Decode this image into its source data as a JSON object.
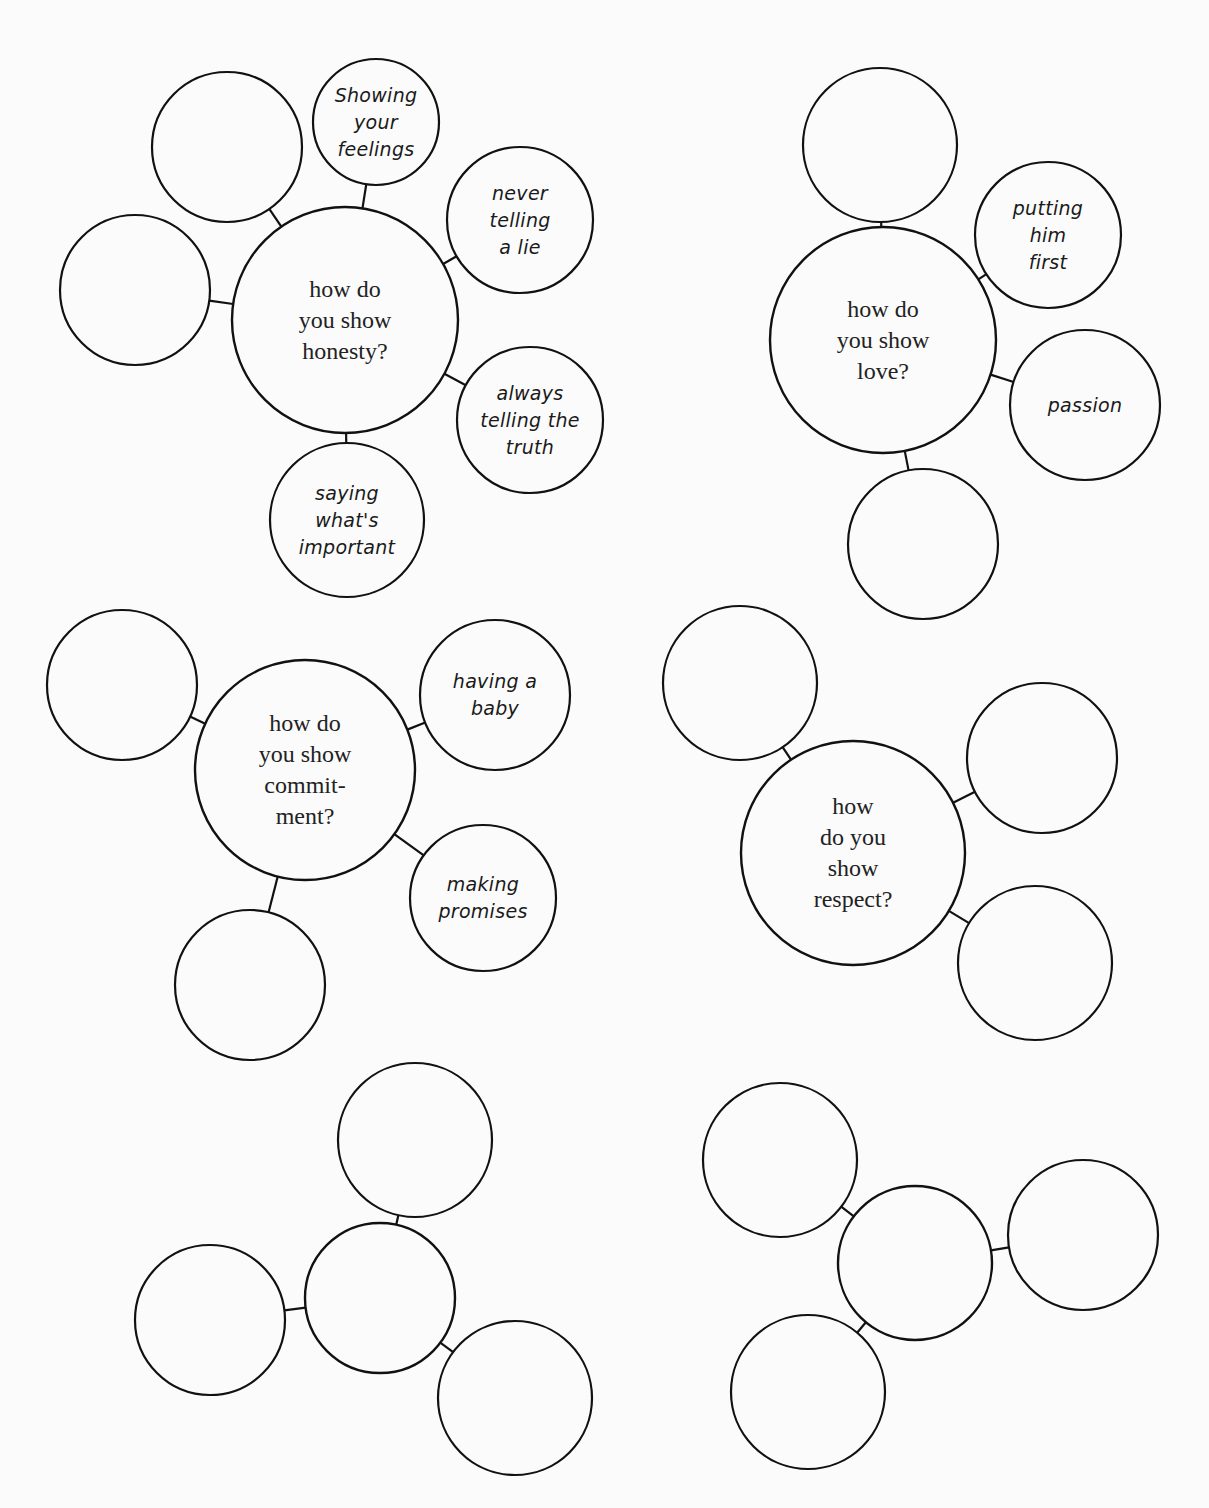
{
  "page": {
    "type": "worksheet",
    "colors": {
      "background": "#fbfbfb",
      "stroke": "#111111",
      "printed_text": "#222222",
      "handwriting": "#1a1a1a"
    }
  },
  "clusters": [
    {
      "id": "honesty",
      "center": {
        "x": 345,
        "y": 320,
        "r": 113,
        "label": "how do\nyou show\nhonesty?"
      },
      "satellites": [
        {
          "x": 227,
          "y": 147,
          "r": 75,
          "text": ""
        },
        {
          "x": 135,
          "y": 290,
          "r": 75,
          "text": ""
        },
        {
          "x": 376,
          "y": 122,
          "r": 63,
          "text": "Showing\nyour\nfeelings"
        },
        {
          "x": 520,
          "y": 220,
          "r": 73,
          "text": "never\ntelling\na lie"
        },
        {
          "x": 530,
          "y": 420,
          "r": 73,
          "text": "always\ntelling the\ntruth"
        },
        {
          "x": 347,
          "y": 520,
          "r": 77,
          "text": "saying\nwhat's\nimportant"
        }
      ]
    },
    {
      "id": "love",
      "center": {
        "x": 883,
        "y": 340,
        "r": 113,
        "label": "how do\nyou show\nlove?"
      },
      "satellites": [
        {
          "x": 880,
          "y": 145,
          "r": 77,
          "text": ""
        },
        {
          "x": 1048,
          "y": 235,
          "r": 73,
          "text": "putting\nhim\nfirst"
        },
        {
          "x": 1085,
          "y": 405,
          "r": 75,
          "text": "passion"
        },
        {
          "x": 923,
          "y": 544,
          "r": 75,
          "text": ""
        }
      ]
    },
    {
      "id": "commitment",
      "center": {
        "x": 305,
        "y": 770,
        "r": 110,
        "label": "how do\nyou show\ncommit-\nment?"
      },
      "satellites": [
        {
          "x": 122,
          "y": 685,
          "r": 75,
          "text": ""
        },
        {
          "x": 495,
          "y": 695,
          "r": 75,
          "text": "having a\nbaby"
        },
        {
          "x": 483,
          "y": 898,
          "r": 73,
          "text": "making\npromises"
        },
        {
          "x": 250,
          "y": 985,
          "r": 75,
          "text": ""
        }
      ]
    },
    {
      "id": "respect",
      "center": {
        "x": 853,
        "y": 853,
        "r": 112,
        "label": "how\ndo you\nshow\nrespect?"
      },
      "satellites": [
        {
          "x": 740,
          "y": 683,
          "r": 77,
          "text": ""
        },
        {
          "x": 1042,
          "y": 758,
          "r": 75,
          "text": ""
        },
        {
          "x": 1035,
          "y": 963,
          "r": 77,
          "text": ""
        }
      ]
    },
    {
      "id": "blank-1",
      "center": {
        "x": 380,
        "y": 1298,
        "r": 75,
        "label": ""
      },
      "satellites": [
        {
          "x": 415,
          "y": 1140,
          "r": 77,
          "text": ""
        },
        {
          "x": 210,
          "y": 1320,
          "r": 75,
          "text": ""
        },
        {
          "x": 515,
          "y": 1398,
          "r": 77,
          "text": ""
        }
      ]
    },
    {
      "id": "blank-2",
      "center": {
        "x": 915,
        "y": 1263,
        "r": 77,
        "label": ""
      },
      "satellites": [
        {
          "x": 780,
          "y": 1160,
          "r": 77,
          "text": ""
        },
        {
          "x": 1083,
          "y": 1235,
          "r": 75,
          "text": ""
        },
        {
          "x": 808,
          "y": 1392,
          "r": 77,
          "text": ""
        }
      ]
    }
  ]
}
